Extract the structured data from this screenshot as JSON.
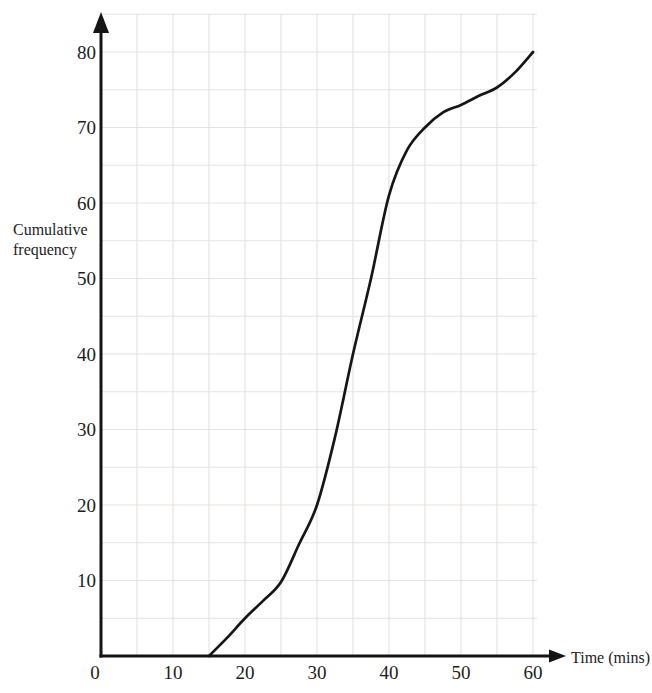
{
  "page": {
    "background": "#ffffff"
  },
  "chart_data": {
    "type": "line",
    "subtype": "cumulative-frequency-curve",
    "title": "",
    "xlabel": "Time (mins)",
    "ylabel": "Cumulative frequency",
    "ylabel_lines": [
      "Cumulative",
      "frequency"
    ],
    "xlim": [
      0,
      62.5
    ],
    "ylim": [
      0,
      85
    ],
    "x_ticks": [
      "0",
      "10",
      "20",
      "30",
      "40",
      "50",
      "60"
    ],
    "x_tick_values": [
      0,
      10,
      20,
      30,
      40,
      50,
      60
    ],
    "y_ticks": [
      "10",
      "20",
      "30",
      "40",
      "50",
      "60",
      "70",
      "80"
    ],
    "y_tick_values": [
      10,
      20,
      30,
      40,
      50,
      60,
      70,
      80
    ],
    "grid": true,
    "grid_step_x": 5,
    "grid_step_y": 5,
    "legend": false,
    "series": [
      {
        "name": "cumulative frequency curve",
        "color": "#161616",
        "points": [
          [
            15,
            0
          ],
          [
            17.5,
            2.4
          ],
          [
            20,
            5
          ],
          [
            22.5,
            7.3
          ],
          [
            25,
            9.8
          ],
          [
            27.5,
            14.8
          ],
          [
            30,
            20
          ],
          [
            32.5,
            29
          ],
          [
            35,
            40
          ],
          [
            37.5,
            50
          ],
          [
            40,
            61
          ],
          [
            42.5,
            67
          ],
          [
            45,
            70
          ],
          [
            47.5,
            72
          ],
          [
            50,
            73
          ],
          [
            52.5,
            74.2
          ],
          [
            55,
            75.3
          ],
          [
            57.5,
            77.3
          ],
          [
            60,
            80
          ]
        ]
      }
    ]
  },
  "colors": {
    "axis": "#141414",
    "grid": "#e7e2de",
    "text": "#1c1c1c",
    "curve": "#161616"
  }
}
